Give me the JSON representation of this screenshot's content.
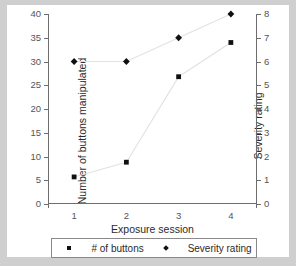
{
  "chart_data": {
    "type": "line",
    "title": "",
    "xlabel": "Exposure session",
    "categories": [
      "1",
      "2",
      "3",
      "4"
    ],
    "x": [
      1,
      2,
      3,
      4
    ],
    "axes": {
      "left": {
        "label": "Number of buttons manipulated",
        "ylim": [
          0,
          40
        ],
        "ticks": [
          0,
          5,
          10,
          15,
          20,
          25,
          30,
          35,
          40
        ],
        "ticklabels": [
          "0",
          "5",
          "10",
          "15",
          "20",
          "25",
          "30",
          "35",
          "40"
        ]
      },
      "right": {
        "label": "Severity rating",
        "ylim": [
          0,
          8
        ],
        "ticks": [
          0,
          1,
          2,
          3,
          4,
          5,
          6,
          7,
          8
        ],
        "ticklabels": [
          "0",
          "1",
          "2",
          "3",
          "4",
          "5",
          "6",
          "7",
          "8"
        ]
      },
      "x": {
        "ticklabels": [
          "1",
          "2",
          "3",
          "4"
        ]
      }
    },
    "grid": false,
    "legend_position": "below-axis-label",
    "series": [
      {
        "name": "# of buttons",
        "axis": "left",
        "marker": "square",
        "values": [
          5.7,
          8.8,
          26.8,
          34.0
        ],
        "line_color": "#e2e2e2",
        "marker_color": "#101010"
      },
      {
        "name": "Severity rating",
        "axis": "right",
        "marker": "diamond",
        "values": [
          6.0,
          6.0,
          7.0,
          8.0
        ],
        "line_color": "#e2e2e2",
        "marker_color": "#101010"
      }
    ]
  },
  "legend": {
    "entries": [
      {
        "label": "# of buttons",
        "marker": "square"
      },
      {
        "label": "Severity rating",
        "marker": "diamond"
      }
    ]
  },
  "colors": {
    "page_background": "#cfcfcf",
    "plot_background": "#ffffff",
    "axis": "#6d6d6d",
    "text": "#2b2b2b",
    "tick_text": "#555555",
    "line": "#e2e2e2",
    "marker": "#101010"
  }
}
